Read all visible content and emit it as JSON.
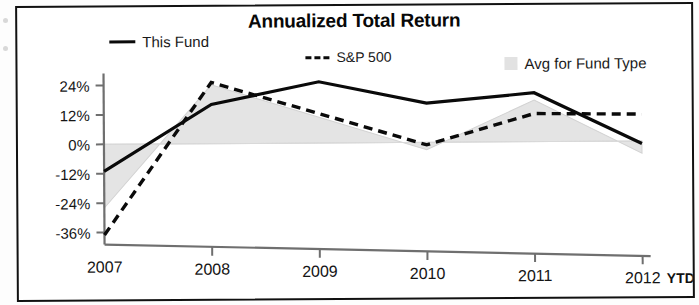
{
  "chart_data": {
    "type": "line",
    "title": "Annualized Total Return",
    "xlabel": "",
    "ylabel": "",
    "x": [
      "2007",
      "2008",
      "2009",
      "2010",
      "2011",
      "2012"
    ],
    "categories": [
      "2007",
      "2008",
      "2009",
      "2010",
      "2011",
      "2012"
    ],
    "x_axis_note": "YTD",
    "ylim": [
      -36,
      24
    ],
    "yticks": [
      24,
      12,
      0,
      -12,
      -24,
      -36
    ],
    "ytick_labels": [
      "24%",
      "12%",
      "0%",
      "-12%",
      "-24%",
      "-36%"
    ],
    "grid": false,
    "legend_position": "top",
    "series": [
      {
        "name": "This Fund",
        "style": "solid-line",
        "color": "#0a0a0a",
        "values": [
          -11,
          16,
          25,
          16,
          20,
          -1
        ]
      },
      {
        "name": "S&P 500",
        "style": "dashed-line",
        "color": "#0a0a0a",
        "values": [
          -37,
          25,
          12,
          -1,
          11.5,
          11
        ]
      },
      {
        "name": "Avg for Fund Type",
        "style": "shaded-area",
        "color": "#e4e4e4",
        "values": [
          -26,
          24,
          10.5,
          -3,
          17,
          -5
        ]
      }
    ]
  },
  "chart": {
    "title": "Annualized Total Return",
    "axis_note": "YTD",
    "legend": [
      {
        "label": "This Fund",
        "marker": "solid-line-swatch"
      },
      {
        "label": "S&P 500",
        "marker": "dashed-line-swatch"
      },
      {
        "label": "Avg for Fund Type",
        "marker": "gray-area-swatch"
      }
    ]
  },
  "colors": {
    "line": "#0a0a0a",
    "area_fill": "#e4e4e4",
    "axis": "#6f6f6f",
    "border": "#111111",
    "text": "#151515"
  }
}
